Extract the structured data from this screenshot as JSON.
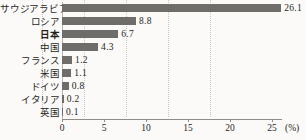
{
  "chart_data": {
    "type": "bar",
    "orientation": "horizontal",
    "title": "",
    "xlabel": "(%)",
    "ylabel": "",
    "xlim": [
      0,
      26.19
    ],
    "xticks": [
      0,
      5,
      10,
      15,
      20,
      25
    ],
    "xtick_labels": [
      "0",
      "5",
      "10",
      "15",
      "20",
      "25"
    ],
    "unit_label": "(%)",
    "grid": "vertical-dotted",
    "legend": "none",
    "categories": [
      "サウジアラビア",
      "ロシア",
      "日本",
      "中国",
      "フランス",
      "米国",
      "ドイツ",
      "イタリア",
      "英国"
    ],
    "values": [
      26.1,
      8.8,
      6.7,
      4.3,
      1.2,
      1.1,
      0.8,
      0.2,
      0.1
    ],
    "value_labels": [
      "26.1",
      "8.8",
      "6.7",
      "4.3",
      "1.2",
      "1.1",
      "0.8",
      "0.2",
      "0.1"
    ],
    "highlight_category": "日本",
    "bar_color": "#6f6d6a",
    "background_color": "#fbfaf8",
    "grid_color": "#c9c6c0",
    "axis_color": "#8f8c86",
    "text_color": "#231f1c"
  },
  "bottom_strip": {
    "text": ""
  }
}
